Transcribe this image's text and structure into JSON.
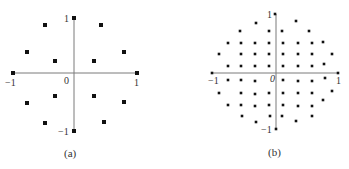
{
  "colors": {
    "axis": "#7a7a7a",
    "point": "#111111",
    "text": "#333333",
    "background": "#ffffff"
  },
  "panels": [
    {
      "id": "a",
      "caption": "(a)",
      "origin": [
        74,
        73
      ],
      "radius_px": [
        62,
        57
      ],
      "marker_size": 4,
      "labels": {
        "y_top": "1",
        "y_bottom": "−1",
        "x_left": "−1",
        "x_right": "1",
        "origin": "0"
      },
      "points_px": [
        [
          74,
          18
        ],
        [
          45,
          25
        ],
        [
          101,
          25
        ],
        [
          27,
          52
        ],
        [
          55,
          61
        ],
        [
          94,
          61
        ],
        [
          124,
          52
        ],
        [
          13,
          73
        ],
        [
          137,
          73
        ],
        [
          27,
          103
        ],
        [
          55,
          96
        ],
        [
          94,
          96
        ],
        [
          124,
          102
        ],
        [
          45,
          123
        ],
        [
          104,
          122
        ],
        [
          74,
          131
        ]
      ]
    },
    {
      "id": "b",
      "caption": "(b)",
      "origin": [
        276,
        73
      ],
      "radius_px": [
        63,
        58
      ],
      "marker_size": 2.6,
      "labels": {
        "y_top": "1",
        "y_bottom": "−1",
        "x_left": "−1",
        "x_right": "1",
        "origin": "0"
      },
      "points_px": [
        [
          256,
          23
        ],
        [
          296,
          21
        ],
        [
          240,
          31
        ],
        [
          269,
          31
        ],
        [
          282,
          31
        ],
        [
          309,
          31
        ],
        [
          228,
          43
        ],
        [
          241,
          43
        ],
        [
          255,
          43
        ],
        [
          269,
          43
        ],
        [
          283,
          43
        ],
        [
          298,
          43
        ],
        [
          312,
          43
        ],
        [
          323,
          42
        ],
        [
          219,
          54
        ],
        [
          241,
          54
        ],
        [
          255,
          54
        ],
        [
          269,
          54
        ],
        [
          283,
          54
        ],
        [
          298,
          54
        ],
        [
          312,
          54
        ],
        [
          332,
          54
        ],
        [
          228,
          66
        ],
        [
          241,
          66
        ],
        [
          255,
          66
        ],
        [
          269,
          66
        ],
        [
          283,
          66
        ],
        [
          298,
          66
        ],
        [
          312,
          66
        ],
        [
          324,
          64
        ],
        [
          228,
          80
        ],
        [
          241,
          80
        ],
        [
          255,
          81
        ],
        [
          283,
          80
        ],
        [
          298,
          81
        ],
        [
          312,
          81
        ],
        [
          325,
          78
        ],
        [
          219,
          93
        ],
        [
          241,
          93
        ],
        [
          255,
          94
        ],
        [
          269,
          93
        ],
        [
          283,
          93
        ],
        [
          298,
          93
        ],
        [
          312,
          93
        ],
        [
          332,
          91
        ],
        [
          228,
          105
        ],
        [
          241,
          105
        ],
        [
          255,
          106
        ],
        [
          269,
          105
        ],
        [
          283,
          105
        ],
        [
          298,
          106
        ],
        [
          312,
          106
        ],
        [
          323,
          100
        ],
        [
          242,
          116
        ],
        [
          270,
          116
        ],
        [
          282,
          116
        ],
        [
          312,
          116
        ],
        [
          256,
          122
        ],
        [
          296,
          121
        ],
        [
          275,
          14
        ],
        [
          212,
          73
        ],
        [
          338,
          73
        ],
        [
          276,
          129
        ]
      ]
    }
  ]
}
